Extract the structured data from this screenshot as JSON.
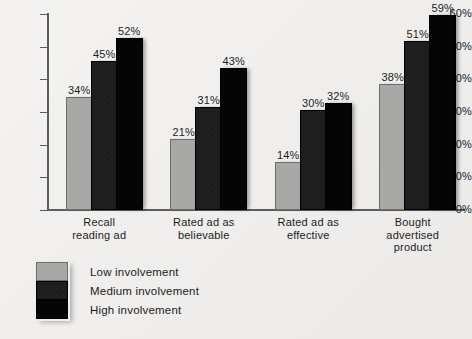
{
  "chart_data": {
    "type": "bar",
    "title": "",
    "xlabel": "",
    "ylabel": "",
    "grid": false,
    "legend_position": "bottom-left",
    "ylim": [
      0,
      60
    ],
    "yticks": [
      0,
      10,
      20,
      30,
      40,
      50,
      60
    ],
    "ytick_labels": [
      "0%",
      "10%",
      "20%",
      "30%",
      "40%",
      "50%",
      "60%"
    ],
    "categories": [
      "Recall\nreading ad",
      "Rated ad as\nbelievable",
      "Rated ad as\neffective",
      "Bought\nadvertised\nproduct"
    ],
    "category_lines": [
      [
        "Recall",
        "reading ad"
      ],
      [
        "Rated ad as",
        "believable"
      ],
      [
        "Rated ad as",
        "effective"
      ],
      [
        "Bought",
        "advertised",
        "product"
      ]
    ],
    "series": [
      {
        "name": "Low involvement",
        "color": "#a8a8a6",
        "values": [
          34,
          21,
          14,
          38
        ],
        "labels": [
          "34%",
          "21%",
          "14%",
          "38%"
        ]
      },
      {
        "name": "Medium involvement",
        "color": "#1e1e1e",
        "values": [
          45,
          31,
          30,
          51
        ],
        "labels": [
          "45%",
          "31%",
          "30%",
          "51%"
        ]
      },
      {
        "name": "High involvement",
        "color": "#050505",
        "values": [
          52,
          43,
          32,
          59
        ],
        "labels": [
          "52%",
          "43%",
          "32%",
          "59%"
        ]
      }
    ]
  },
  "legend": {
    "items": [
      {
        "label": "Low involvement",
        "swatch": "low"
      },
      {
        "label": "Medium involvement",
        "swatch": "medium"
      },
      {
        "label": "High involvement",
        "swatch": "high"
      }
    ]
  }
}
